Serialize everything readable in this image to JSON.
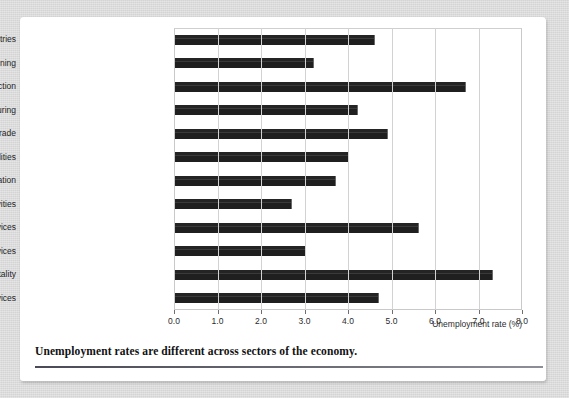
{
  "chart_data": {
    "type": "bar",
    "orientation": "horizontal",
    "title": "",
    "xlabel": "Unemployment rate (%)",
    "ylabel": "",
    "xlim": [
      0.0,
      8.0
    ],
    "xticks": [
      "0.0",
      "1.0",
      "2.0",
      "3.0",
      "4.0",
      "5.0",
      "6.0",
      "7.0",
      "8.0"
    ],
    "xtick_values": [
      0.0,
      1.0,
      2.0,
      3.0,
      4.0,
      5.0,
      6.0,
      7.0,
      8.0
    ],
    "grid": "vertical",
    "legend": "none",
    "bar_color": "#242424",
    "categories": [
      "All industries",
      "Mining",
      "Construction",
      "Manufacturing",
      "Wholesale and retail trade",
      "Transportation and utilities",
      "Information",
      "Financial activities",
      "Professional and business services",
      "Education and health services",
      "Leisure and hospitality",
      "Other services"
    ],
    "values": [
      4.6,
      3.2,
      6.7,
      4.2,
      4.9,
      4.0,
      3.7,
      2.7,
      5.6,
      3.0,
      7.3,
      4.7
    ]
  },
  "caption": {
    "text": "Unemployment rates are different across sectors of the economy."
  }
}
